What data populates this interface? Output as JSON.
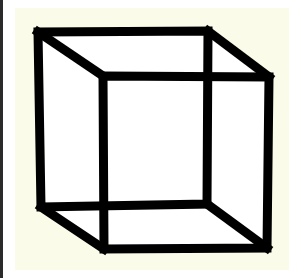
{
  "figure": {
    "background_color": "#fbfbe9",
    "stroke_color": "#000000",
    "face_fill": "#ffffff",
    "back_square": {
      "tl": [
        38,
        32
      ],
      "tr": [
        208,
        31
      ],
      "br": [
        207,
        204
      ],
      "bl": [
        41,
        207
      ]
    },
    "front_square": {
      "tl": [
        103,
        76
      ],
      "tr": [
        269,
        77
      ],
      "br": [
        267,
        248
      ],
      "bl": [
        104,
        249
      ]
    }
  }
}
